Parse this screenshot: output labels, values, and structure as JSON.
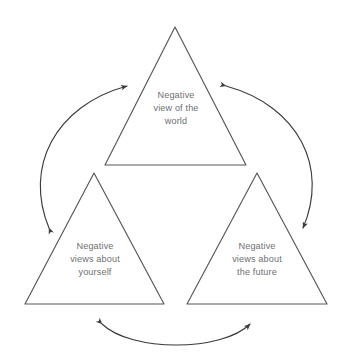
{
  "diagram": {
    "type": "cyclic-triad",
    "background_color": "#ffffff",
    "shape_stroke_color": "#55565a",
    "arrow_stroke_color": "#3a3b3e",
    "label_text_color": "#6e6f73",
    "nodes": [
      {
        "id": "world",
        "label": "Negative\nview of the\nworld",
        "position": "top",
        "shape": "rounded-triangle"
      },
      {
        "id": "self",
        "label": "Negative\nviews about\nyourself",
        "position": "bottom-left",
        "shape": "rounded-triangle"
      },
      {
        "id": "future",
        "label": "Negative\nviews about\nthe future",
        "position": "bottom-right",
        "shape": "rounded-triangle"
      }
    ],
    "connectors": [
      {
        "id": "world-self",
        "from": "world",
        "to": "self",
        "style": "curved-arc",
        "direction": "bidirectional",
        "side": "left"
      },
      {
        "id": "world-future",
        "from": "world",
        "to": "future",
        "style": "curved-arc",
        "direction": "bidirectional",
        "side": "right"
      },
      {
        "id": "self-future",
        "from": "self",
        "to": "future",
        "style": "curved-arc",
        "direction": "bidirectional",
        "side": "bottom"
      }
    ]
  }
}
